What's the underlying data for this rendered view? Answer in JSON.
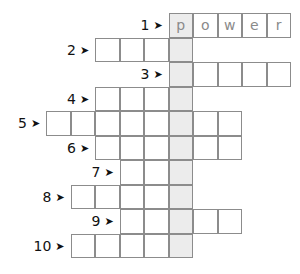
{
  "puzzle": {
    "type": "crossword",
    "cell_size": 24.5,
    "grid_origin_x": 46,
    "grid_origin_y": 13,
    "highlight_column": 5,
    "colors": {
      "border": "#8c8c8c",
      "highlight": "#ececec",
      "letters": "#8a8a8a"
    },
    "rows": [
      {
        "number": "1",
        "start_col": 5,
        "length": 5,
        "letters": [
          "p",
          "o",
          "w",
          "e",
          "r"
        ]
      },
      {
        "number": "2",
        "start_col": 2,
        "length": 4,
        "letters": []
      },
      {
        "number": "3",
        "start_col": 5,
        "length": 5,
        "letters": []
      },
      {
        "number": "4",
        "start_col": 2,
        "length": 4,
        "letters": []
      },
      {
        "number": "5",
        "start_col": 0,
        "length": 8,
        "letters": []
      },
      {
        "number": "6",
        "start_col": 2,
        "length": 6,
        "letters": []
      },
      {
        "number": "7",
        "start_col": 3,
        "length": 3,
        "letters": []
      },
      {
        "number": "8",
        "start_col": 1,
        "length": 5,
        "letters": []
      },
      {
        "number": "9",
        "start_col": 3,
        "length": 5,
        "letters": []
      },
      {
        "number": "10",
        "start_col": 1,
        "length": 5,
        "letters": []
      }
    ],
    "arrow_glyph": "➤"
  }
}
